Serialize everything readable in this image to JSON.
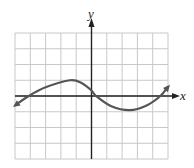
{
  "chart_data": {
    "type": "line",
    "title": "",
    "xlabel": "x",
    "ylabel": "y",
    "xlim": [
      -5,
      5
    ],
    "ylim": [
      -4,
      4
    ],
    "grid": true,
    "tick_labels": false,
    "series": [
      {
        "name": "f(x)",
        "color": "#555555",
        "arrows_at_ends": true,
        "points": [
          {
            "x": -5.0,
            "y": -0.6
          },
          {
            "x": -4.1,
            "y": 0.0
          },
          {
            "x": -3.0,
            "y": 0.55
          },
          {
            "x": -1.4,
            "y": 1.0
          },
          {
            "x": -0.6,
            "y": 0.8
          },
          {
            "x": 0.0,
            "y": 0.35
          },
          {
            "x": 0.3,
            "y": 0.0
          },
          {
            "x": 1.3,
            "y": -0.65
          },
          {
            "x": 2.5,
            "y": -0.9
          },
          {
            "x": 3.6,
            "y": -0.6
          },
          {
            "x": 4.5,
            "y": 0.0
          },
          {
            "x": 5.0,
            "y": 0.6
          }
        ]
      }
    ]
  },
  "labels": {
    "x_axis": "x",
    "y_axis": "y"
  },
  "colors": {
    "grid": "#c8c8c8",
    "axis": "#222222",
    "curve": "#555555"
  }
}
